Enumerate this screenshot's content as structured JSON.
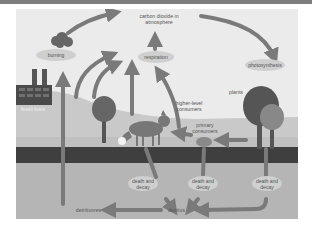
{
  "diagram": {
    "nodes": {
      "atmosphere": "carbon dioxide in atmosphere",
      "atmosphere_line1": "carbon dioxide in",
      "atmosphere_line2": "atmosphere",
      "respiration": "respiration",
      "photosynthesis": "photosynthesis",
      "burning": "burning",
      "fossil_fuels": "fossil fuels",
      "plants": "plants",
      "higher_consumers_line1": "higher-level",
      "higher_consumers_line2": "consumers",
      "primary_consumers_line1": "primary",
      "primary_consumers_line2": "consumers",
      "death_decay_line1": "death and",
      "death_decay_line2": "decay",
      "detritus": "detritus",
      "detritivores": "detritivores"
    },
    "colors": {
      "panel_bg": "#ebebeb",
      "arrow": "#7a7a7a",
      "pill": "#cfcfcf",
      "soil": "#3f3f3f",
      "ground": "#b5b5b5",
      "hill": "#c9c9c9",
      "tree_dark": "#606060",
      "topbar": "#7d7d7d"
    },
    "edges": [
      {
        "from": "burning",
        "to": "atmosphere"
      },
      {
        "from": "respiration",
        "to": "atmosphere"
      },
      {
        "from": "atmosphere",
        "to": "photosynthesis"
      },
      {
        "from": "plants",
        "to": "respiration"
      },
      {
        "from": "higher_consumers",
        "to": "respiration"
      },
      {
        "from": "plants",
        "to": "primary_consumers"
      },
      {
        "from": "primary_consumers",
        "to": "higher_consumers"
      },
      {
        "from": "death_and_decay",
        "to": "detritus"
      },
      {
        "from": "detritus",
        "to": "detritivores"
      },
      {
        "from": "fossil_fuels",
        "to": "burning"
      }
    ]
  }
}
